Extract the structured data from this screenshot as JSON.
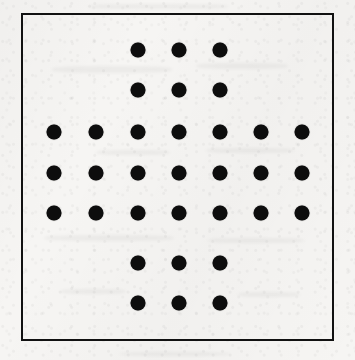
{
  "page": {
    "width": 355,
    "height": 360,
    "background_color": "#f6f5f3",
    "medium": "scanned paper"
  },
  "figure": {
    "name": "dot-array-plus-shape",
    "border_color": "#111111",
    "border_width_px": 2,
    "frame": {
      "left": 21,
      "top": 13,
      "width": 313,
      "height": 328
    }
  },
  "chart_data": {
    "type": "scatter",
    "title": "",
    "subtitle": "",
    "xlabel": "",
    "ylabel": "",
    "grid": false,
    "legend_position": "none",
    "marker": {
      "shape": "circle",
      "fill_color": "#0d0d0d",
      "diameter_px": 15
    },
    "axis": {
      "xlim": [
        0,
        8
      ],
      "ylim": [
        0,
        8
      ],
      "x_ticks": [
        1,
        2,
        3,
        4,
        5,
        6,
        7
      ],
      "y_ticks": [
        1,
        2,
        3,
        4,
        5,
        6,
        7
      ],
      "tick_labels_visible": false
    },
    "grid_layout": {
      "columns": 7,
      "rows": 7,
      "column_x_px": [
        54,
        96,
        138,
        179,
        220,
        261,
        302
      ],
      "row_y_px": [
        50,
        90,
        132,
        173,
        213,
        263,
        303
      ],
      "column_spacing_px": 41,
      "row_spacing_px": 41
    },
    "dot_count_total": 33,
    "dots_per_row": [
      3,
      3,
      7,
      7,
      7,
      3,
      3
    ],
    "occupancy_matrix": [
      [
        0,
        0,
        1,
        1,
        1,
        0,
        0
      ],
      [
        0,
        0,
        1,
        1,
        1,
        0,
        0
      ],
      [
        1,
        1,
        1,
        1,
        1,
        1,
        1
      ],
      [
        1,
        1,
        1,
        1,
        1,
        1,
        1
      ],
      [
        1,
        1,
        1,
        1,
        1,
        1,
        1
      ],
      [
        0,
        0,
        1,
        1,
        1,
        0,
        0
      ],
      [
        0,
        0,
        1,
        1,
        1,
        0,
        0
      ]
    ],
    "points_px": [
      {
        "x": 138,
        "y": 50
      },
      {
        "x": 179,
        "y": 50
      },
      {
        "x": 220,
        "y": 50
      },
      {
        "x": 138,
        "y": 90
      },
      {
        "x": 179,
        "y": 90
      },
      {
        "x": 220,
        "y": 90
      },
      {
        "x": 54,
        "y": 132
      },
      {
        "x": 96,
        "y": 132
      },
      {
        "x": 138,
        "y": 132
      },
      {
        "x": 179,
        "y": 132
      },
      {
        "x": 220,
        "y": 132
      },
      {
        "x": 261,
        "y": 132
      },
      {
        "x": 302,
        "y": 132
      },
      {
        "x": 54,
        "y": 173
      },
      {
        "x": 96,
        "y": 173
      },
      {
        "x": 138,
        "y": 173
      },
      {
        "x": 179,
        "y": 173
      },
      {
        "x": 220,
        "y": 173
      },
      {
        "x": 261,
        "y": 173
      },
      {
        "x": 302,
        "y": 173
      },
      {
        "x": 54,
        "y": 213
      },
      {
        "x": 96,
        "y": 213
      },
      {
        "x": 138,
        "y": 213
      },
      {
        "x": 179,
        "y": 213
      },
      {
        "x": 220,
        "y": 213
      },
      {
        "x": 261,
        "y": 213
      },
      {
        "x": 302,
        "y": 213
      },
      {
        "x": 138,
        "y": 263
      },
      {
        "x": 179,
        "y": 263
      },
      {
        "x": 220,
        "y": 263
      },
      {
        "x": 138,
        "y": 303
      },
      {
        "x": 179,
        "y": 303
      },
      {
        "x": 220,
        "y": 303
      }
    ]
  },
  "smudges": [
    {
      "left": 52,
      "top": 66,
      "width": 120,
      "height": 7
    },
    {
      "left": 196,
      "top": 63,
      "width": 92,
      "height": 6
    },
    {
      "left": 96,
      "top": 150,
      "width": 74,
      "height": 5
    },
    {
      "left": 206,
      "top": 148,
      "width": 88,
      "height": 5
    },
    {
      "left": 44,
      "top": 235,
      "width": 130,
      "height": 6
    },
    {
      "left": 208,
      "top": 238,
      "width": 96,
      "height": 5
    },
    {
      "left": 60,
      "top": 289,
      "width": 66,
      "height": 5
    },
    {
      "left": 238,
      "top": 292,
      "width": 62,
      "height": 5
    },
    {
      "left": 88,
      "top": 4,
      "width": 140,
      "height": 5
    },
    {
      "left": 120,
      "top": 352,
      "width": 110,
      "height": 4
    }
  ]
}
